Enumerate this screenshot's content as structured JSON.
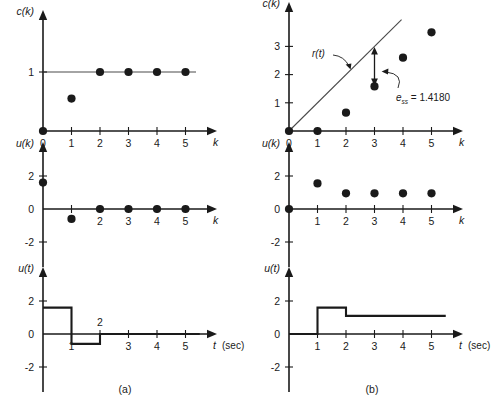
{
  "figure": {
    "captions": [
      {
        "label": "(a)",
        "x": 125,
        "y": 393
      },
      {
        "label": "(b)",
        "x": 372,
        "y": 393
      }
    ]
  },
  "chart_data": [
    {
      "id": "panel-a-ck",
      "type": "scatter",
      "title": "",
      "ylabel": "c(k)",
      "xlabel": "k",
      "x": [
        0,
        1,
        2,
        3,
        4,
        5
      ],
      "values": [
        0,
        0.55,
        1,
        1,
        1,
        1
      ],
      "xticks": [
        0,
        1,
        2,
        3,
        4,
        5
      ],
      "yticks": [
        1
      ],
      "xlim": [
        0,
        5.8
      ],
      "ylim": [
        0,
        1.45
      ],
      "reference_line": {
        "kind": "horizontal",
        "value": 1
      },
      "grid": false,
      "legend": "none"
    },
    {
      "id": "panel-b-ck",
      "type": "scatter",
      "title": "",
      "ylabel": "c(k)",
      "xlabel": "k",
      "x": [
        0,
        1,
        2,
        3,
        4,
        5
      ],
      "values": [
        0,
        0,
        0.65,
        1.58,
        2.6,
        3.5
      ],
      "xticks": [
        0,
        1,
        2,
        3,
        4,
        5
      ],
      "yticks": [
        1,
        2,
        3
      ],
      "xlim": [
        0,
        5.8
      ],
      "ylim": [
        0,
        4.0
      ],
      "reference_line": {
        "kind": "ramp",
        "slope": 1,
        "label": "r(t)"
      },
      "annotations": [
        {
          "name": "steady-state-error",
          "text": "e",
          "subscript": "ss",
          "value": "= 1.4180",
          "at_k": 3,
          "from": 1.58,
          "to": 3.0
        }
      ],
      "grid": false,
      "legend": "none"
    },
    {
      "id": "panel-a-uk",
      "type": "scatter",
      "title": "",
      "ylabel": "u(k)",
      "xlabel": "k",
      "x": [
        0,
        1,
        2,
        3,
        4,
        5
      ],
      "values": [
        1.6,
        -0.6,
        0,
        0,
        0,
        0
      ],
      "xticks": [
        2,
        3,
        4,
        5
      ],
      "yticks": [
        -2,
        0,
        2
      ],
      "xlim": [
        0,
        5.8
      ],
      "ylim": [
        -3,
        3
      ],
      "grid": false,
      "legend": "none"
    },
    {
      "id": "panel-b-uk",
      "type": "scatter",
      "title": "",
      "ylabel": "u(k)",
      "xlabel": "k",
      "x": [
        0,
        1,
        2,
        3,
        4,
        5
      ],
      "values": [
        0,
        1.55,
        0.95,
        0.95,
        0.95,
        0.95
      ],
      "xticks": [
        1,
        2,
        3,
        4,
        5
      ],
      "yticks": [
        -2,
        0,
        2
      ],
      "xlim": [
        0,
        5.8
      ],
      "ylim": [
        -3,
        3
      ],
      "grid": false,
      "legend": "none"
    },
    {
      "id": "panel-a-ut",
      "type": "line",
      "title": "",
      "ylabel": "u(t)",
      "xlabel": "t",
      "xunit": "(sec)",
      "steps": [
        {
          "t_start": 0,
          "t_end": 1,
          "value": 1.6
        },
        {
          "t_start": 1,
          "t_end": 2,
          "value": -0.6
        },
        {
          "t_start": 2,
          "t_end": 5.5,
          "value": 0
        }
      ],
      "xticks": [
        1,
        3,
        4,
        5
      ],
      "xticks_above": [
        2
      ],
      "yticks": [
        -2,
        0,
        2
      ],
      "xlim": [
        0,
        5.8
      ],
      "ylim": [
        -3,
        3
      ],
      "grid": false,
      "legend": "none"
    },
    {
      "id": "panel-b-ut",
      "type": "line",
      "title": "",
      "ylabel": "u(t)",
      "xlabel": "t",
      "xunit": "(sec)",
      "steps": [
        {
          "t_start": 0,
          "t_end": 1,
          "value": 0
        },
        {
          "t_start": 1,
          "t_end": 2,
          "value": 1.6
        },
        {
          "t_start": 2,
          "t_end": 5.5,
          "value": 1.1
        }
      ],
      "xticks": [
        1,
        2,
        3,
        4,
        5
      ],
      "xticks_above": [],
      "yticks": [
        -2,
        0,
        2
      ],
      "xlim": [
        0,
        5.8
      ],
      "ylim": [
        -3,
        3
      ],
      "grid": false,
      "legend": "none"
    }
  ]
}
